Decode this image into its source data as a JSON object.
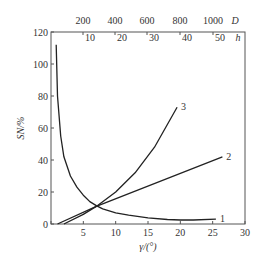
{
  "chart_data": {
    "type": "line",
    "title": "",
    "xlabel": "γ/(°)",
    "ylabel": "S_N/%",
    "xlim": [
      0,
      30
    ],
    "ylim": [
      0,
      120
    ],
    "x_ticks": [
      0,
      5,
      10,
      15,
      20,
      25,
      30
    ],
    "y_ticks": [
      0,
      20,
      40,
      60,
      80,
      100,
      120
    ],
    "top_axis_D": {
      "label": "D",
      "ticks": [
        200,
        400,
        600,
        800,
        1000
      ]
    },
    "top_axis_h": {
      "label": "h",
      "ticks": [
        10,
        20,
        30,
        40,
        50
      ]
    },
    "grid": false,
    "series": [
      {
        "name": "1",
        "x": [
          0.8,
          1,
          1.5,
          2,
          3,
          4,
          5,
          6,
          7,
          8,
          10,
          12,
          15,
          18,
          20,
          22,
          25.5
        ],
        "y": [
          112,
          80,
          55,
          42,
          30,
          23,
          18,
          14,
          11.5,
          9.5,
          7,
          5.5,
          3.8,
          2.8,
          2.5,
          2.5,
          3
        ]
      },
      {
        "name": "2",
        "x": [
          1,
          7,
          26.5
        ],
        "y": [
          0,
          11,
          42
        ]
      },
      {
        "name": "3",
        "x": [
          2,
          5,
          7,
          10,
          13,
          16,
          19.5
        ],
        "y": [
          0,
          6,
          11,
          20,
          32,
          48,
          73
        ]
      }
    ]
  }
}
